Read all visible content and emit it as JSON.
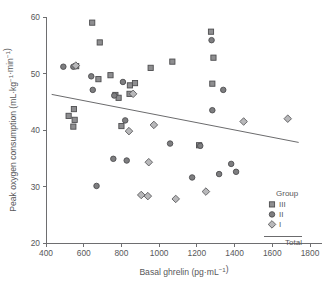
{
  "chart_data": {
    "type": "scatter",
    "title": "",
    "xlabel": "Basal ghrelin (pg·mL⁻¹)",
    "ylabel": "Peak oxygen consumption (mL·kg⁻¹·min⁻¹)",
    "xlim": [
      400,
      1800
    ],
    "ylim": [
      20,
      60
    ],
    "xticks": [
      400,
      600,
      800,
      1000,
      1200,
      1400,
      1600,
      1800
    ],
    "yticks": [
      20,
      30,
      40,
      50,
      60
    ],
    "grid": false,
    "legend_position": "bottom-right",
    "legend_title": "Group",
    "series": [
      {
        "name": "III",
        "marker": "square",
        "color": "#8e8e90",
        "points": [
          [
            645,
            59.0
          ],
          [
            685,
            55.5
          ],
          [
            520,
            42.5
          ],
          [
            548,
            43.7
          ],
          [
            552,
            41.8
          ],
          [
            545,
            40.6
          ],
          [
            560,
            51.3
          ],
          [
            678,
            49.0
          ],
          [
            742,
            49.7
          ],
          [
            768,
            46.2
          ],
          [
            785,
            45.7
          ],
          [
            845,
            47.9
          ],
          [
            872,
            48.3
          ],
          [
            955,
            51.0
          ],
          [
            800,
            40.7
          ],
          [
            1070,
            52.1
          ],
          [
            1275,
            57.4
          ],
          [
            1288,
            52.8
          ],
          [
            1282,
            48.2
          ],
          [
            1212,
            37.3
          ],
          [
            843,
            46.4
          ]
        ]
      },
      {
        "name": "II",
        "marker": "circle",
        "color": "#7e7e80",
        "points": [
          [
            492,
            51.2
          ],
          [
            545,
            51.2
          ],
          [
            640,
            49.5
          ],
          [
            648,
            47.1
          ],
          [
            762,
            46.1
          ],
          [
            808,
            48.5
          ],
          [
            820,
            41.7
          ],
          [
            668,
            30.1
          ],
          [
            757,
            34.9
          ],
          [
            828,
            34.6
          ],
          [
            1058,
            37.6
          ],
          [
            1278,
            55.9
          ],
          [
            1282,
            43.5
          ],
          [
            1340,
            47.1
          ],
          [
            1218,
            37.2
          ],
          [
            1175,
            31.6
          ],
          [
            1318,
            32.2
          ],
          [
            1382,
            34.0
          ],
          [
            1408,
            32.6
          ]
        ]
      },
      {
        "name": "I",
        "marker": "diamond",
        "color": "#b8b8ba",
        "points": [
          [
            558,
            51.4
          ],
          [
            840,
            39.8
          ],
          [
            972,
            40.9
          ],
          [
            945,
            34.3
          ],
          [
            862,
            46.4
          ],
          [
            905,
            28.5
          ],
          [
            940,
            28.3
          ],
          [
            1088,
            27.8
          ],
          [
            1248,
            29.1
          ],
          [
            1448,
            41.5
          ],
          [
            1682,
            42.0
          ]
        ]
      }
    ],
    "trend": {
      "name": "Total",
      "x_start": 430,
      "y_start": 46.3,
      "x_end": 1740,
      "y_end": 37.8
    }
  }
}
